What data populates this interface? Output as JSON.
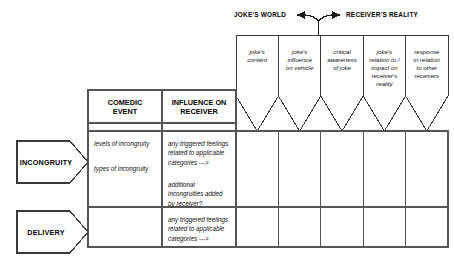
{
  "diagram": {
    "title_axis": {
      "left_label": "JOKE'S WORLD",
      "right_label": "RECEIVER'S REALITY"
    },
    "funnel_columns": [
      {
        "id": "jokes-content",
        "label": "joke's\ncontent"
      },
      {
        "id": "jokes-influence",
        "label": "joke's\ninfluence\non vehicle"
      },
      {
        "id": "critical-awareness",
        "label": "critical\nawareness\nof joke"
      },
      {
        "id": "jokes-relation",
        "label": "joke's\nrelation to /\nimpact on\nreceiver's\nreality"
      },
      {
        "id": "response-relation",
        "label": "response\nin relation\nto other\nreceivers"
      }
    ],
    "table": {
      "headers": [
        {
          "id": "comedic-event",
          "label": "COMEDIC\nEVENT"
        },
        {
          "id": "influence-on-receiver",
          "label": "INFLUENCE ON\nRECEIVER"
        }
      ],
      "rows": [
        {
          "id": "incongruity",
          "tag": "INCONGRUITY",
          "comedic_event": "levels of incongruity",
          "comedic_event_2": "types of incongruity",
          "influence": "any triggered feelings\nrelated to applicable\ncategories   --->",
          "influence_2": "additional\nincongruities added\nby receiver?"
        },
        {
          "id": "delivery",
          "tag": "DELIVERY",
          "comedic_event": "",
          "comedic_event_2": "",
          "influence": "any triggered feelings\nrelated to applicable\ncategories   --->",
          "influence_2": ""
        }
      ]
    },
    "colors": {
      "line": "#3a3a3a",
      "line_heavy": "#555555",
      "text": "#111111",
      "background": "#ffffff"
    }
  }
}
